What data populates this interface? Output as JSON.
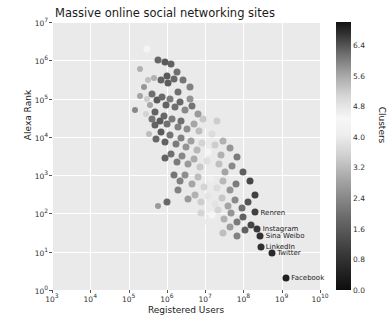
{
  "chart_data": {
    "type": "scatter",
    "title": "Massive online social networking sites",
    "xlabel": "Registered Users",
    "ylabel": "Alexa Rank",
    "xscale": "log",
    "yscale": "log",
    "xlim": [
      1000,
      10000000000
    ],
    "ylim": [
      1,
      10000000
    ],
    "xticklabels": [
      "10^3",
      "10^4",
      "10^5",
      "10^6",
      "10^7",
      "10^8",
      "10^9",
      "10^10"
    ],
    "yticklabels": [
      "10^0",
      "10^1",
      "10^2",
      "10^3",
      "10^4",
      "10^5",
      "10^6",
      "10^7"
    ],
    "grid": true,
    "colorbar": {
      "label": "Clusters",
      "ticks": [
        "0.0",
        "0.8",
        "1.6",
        "2.4",
        "3.2",
        "4.0",
        "4.8",
        "5.6",
        "6.4"
      ],
      "vmin": 0.0,
      "vmax": 7.0
    },
    "annotations": [
      {
        "text": "Renren",
        "x": 220000000.0,
        "y": 100.0
      },
      {
        "text": "Instagram",
        "x": 250000000.0,
        "y": 40.0
      },
      {
        "text": "Sina Weibo",
        "x": 300000000.0,
        "y": 26.0
      },
      {
        "text": "LinkedIn",
        "x": 300000000.0,
        "y": 13.0
      },
      {
        "text": "Twitter",
        "x": 600000000.0,
        "y": 9.0
      },
      {
        "text": "Facebook",
        "x": 1400000000.0,
        "y": 2.0
      }
    ],
    "points": [
      {
        "x": 300000.0,
        "y": 2000000.0,
        "c": 3.6,
        "s": 7
      },
      {
        "x": 600000.0,
        "y": 1000000.0,
        "c": 1.2,
        "s": 7
      },
      {
        "x": 900000.0,
        "y": 900000.0,
        "c": 1.0,
        "s": 7
      },
      {
        "x": 1300000.0,
        "y": 800000.0,
        "c": 1.1,
        "s": 7
      },
      {
        "x": 1800000.0,
        "y": 500000.0,
        "c": 1.3,
        "s": 7
      },
      {
        "x": 320000.0,
        "y": 300000.0,
        "c": 4.4,
        "s": 6
      },
      {
        "x": 450000.0,
        "y": 350000.0,
        "c": 4.6,
        "s": 6
      },
      {
        "x": 700000.0,
        "y": 300000.0,
        "c": 1.1,
        "s": 7
      },
      {
        "x": 1100000.0,
        "y": 260000.0,
        "c": 1.0,
        "s": 7
      },
      {
        "x": 1500000.0,
        "y": 320000.0,
        "c": 1.2,
        "s": 7
      },
      {
        "x": 2600000.0,
        "y": 300000.0,
        "c": 1.4,
        "s": 7
      },
      {
        "x": 4000000.0,
        "y": 200000.0,
        "c": 1.6,
        "s": 7
      },
      {
        "x": 200000.0,
        "y": 120000.0,
        "c": 4.8,
        "s": 6
      },
      {
        "x": 300000.0,
        "y": 100000.0,
        "c": 4.2,
        "s": 6
      },
      {
        "x": 420000.0,
        "y": 130000.0,
        "c": 1.3,
        "s": 7
      },
      {
        "x": 550000.0,
        "y": 90000.0,
        "c": 1.0,
        "s": 7
      },
      {
        "x": 750000.0,
        "y": 110000.0,
        "c": 1.2,
        "s": 7
      },
      {
        "x": 950000.0,
        "y": 70000.0,
        "c": 1.1,
        "s": 7
      },
      {
        "x": 1200000.0,
        "y": 100000.0,
        "c": 1.5,
        "s": 7
      },
      {
        "x": 1600000.0,
        "y": 60000.0,
        "c": 1.3,
        "s": 7
      },
      {
        "x": 2200000.0,
        "y": 80000.0,
        "c": 1.2,
        "s": 7
      },
      {
        "x": 3000000.0,
        "y": 50000.0,
        "c": 1.7,
        "s": 7
      },
      {
        "x": 4500000.0,
        "y": 65000.0,
        "c": 1.4,
        "s": 7
      },
      {
        "x": 6500000.0,
        "y": 40000.0,
        "c": 2.0,
        "s": 7
      },
      {
        "x": 280000.0,
        "y": 40000.0,
        "c": 3.0,
        "s": 6
      },
      {
        "x": 400000.0,
        "y": 30000.0,
        "c": 1.4,
        "s": 7
      },
      {
        "x": 500000.0,
        "y": 45000.0,
        "c": 1.1,
        "s": 7
      },
      {
        "x": 650000.0,
        "y": 26000.0,
        "c": 1.0,
        "s": 7
      },
      {
        "x": 850000.0,
        "y": 36000.0,
        "c": 1.2,
        "s": 7
      },
      {
        "x": 1000000.0,
        "y": 22000.0,
        "c": 1.3,
        "s": 7
      },
      {
        "x": 1400000.0,
        "y": 30000.0,
        "c": 1.5,
        "s": 7
      },
      {
        "x": 1900000.0,
        "y": 18000.0,
        "c": 1.6,
        "s": 7
      },
      {
        "x": 2400000.0,
        "y": 26000.0,
        "c": 1.3,
        "s": 7
      },
      {
        "x": 3400000.0,
        "y": 16000.0,
        "c": 1.8,
        "s": 7
      },
      {
        "x": 5000000.0,
        "y": 22000.0,
        "c": 2.2,
        "s": 7
      },
      {
        "x": 7000000.0,
        "y": 14000.0,
        "c": 2.6,
        "s": 7
      },
      {
        "x": 10000000.0,
        "y": 20000.0,
        "c": 3.4,
        "s": 7
      },
      {
        "x": 15000000.0,
        "y": 12000.0,
        "c": 4.0,
        "s": 7
      },
      {
        "x": 350000.0,
        "y": 12000.0,
        "c": 2.6,
        "s": 6
      },
      {
        "x": 520000.0,
        "y": 9000.0,
        "c": 1.2,
        "s": 7
      },
      {
        "x": 700000.0,
        "y": 13000.0,
        "c": 1.0,
        "s": 7
      },
      {
        "x": 900000.0,
        "y": 7500.0,
        "c": 1.1,
        "s": 7
      },
      {
        "x": 1200000.0,
        "y": 11000.0,
        "c": 1.4,
        "s": 7
      },
      {
        "x": 1700000.0,
        "y": 6500.0,
        "c": 1.5,
        "s": 7
      },
      {
        "x": 2300000.0,
        "y": 9500.0,
        "c": 1.6,
        "s": 7
      },
      {
        "x": 3100000.0,
        "y": 5500.0,
        "c": 1.9,
        "s": 7
      },
      {
        "x": 4200000.0,
        "y": 8000.0,
        "c": 2.1,
        "s": 7
      },
      {
        "x": 6000000.0,
        "y": 4500.0,
        "c": 2.5,
        "s": 7
      },
      {
        "x": 8500000.0,
        "y": 7000.0,
        "c": 3.0,
        "s": 7
      },
      {
        "x": 12000000.0,
        "y": 4000.0,
        "c": 3.6,
        "s": 7
      },
      {
        "x": 18000000.0,
        "y": 6000.0,
        "c": 4.2,
        "s": 7
      },
      {
        "x": 26000000.0,
        "y": 3400.0,
        "c": 4.6,
        "s": 7
      },
      {
        "x": 900000.0,
        "y": 2800.0,
        "c": 1.1,
        "s": 7
      },
      {
        "x": 1300000.0,
        "y": 3600.0,
        "c": 1.3,
        "s": 7
      },
      {
        "x": 1800000.0,
        "y": 2200.0,
        "c": 1.5,
        "s": 7
      },
      {
        "x": 2500000.0,
        "y": 3200.0,
        "c": 1.7,
        "s": 7
      },
      {
        "x": 3600000.0,
        "y": 1900.0,
        "c": 2.0,
        "s": 7
      },
      {
        "x": 5000000.0,
        "y": 2700.0,
        "c": 2.3,
        "s": 7
      },
      {
        "x": 7500000.0,
        "y": 1600.0,
        "c": 2.8,
        "s": 7
      },
      {
        "x": 11000000.0,
        "y": 2400.0,
        "c": 3.2,
        "s": 7
      },
      {
        "x": 16000000.0,
        "y": 1400.0,
        "c": 3.8,
        "s": 7
      },
      {
        "x": 23000000.0,
        "y": 2000.0,
        "c": 4.4,
        "s": 7
      },
      {
        "x": 34000000.0,
        "y": 1200.0,
        "c": 4.8,
        "s": 7
      },
      {
        "x": 50000000.0,
        "y": 1700.0,
        "c": 5.2,
        "s": 7
      },
      {
        "x": 1500000.0,
        "y": 1000.0,
        "c": 1.4,
        "s": 7
      },
      {
        "x": 2200000.0,
        "y": 700.0,
        "c": 1.6,
        "s": 7
      },
      {
        "x": 3000000.0,
        "y": 1000.0,
        "c": 1.8,
        "s": 7
      },
      {
        "x": 4500000.0,
        "y": 600.0,
        "c": 2.2,
        "s": 7
      },
      {
        "x": 6500000.0,
        "y": 900.0,
        "c": 2.6,
        "s": 7
      },
      {
        "x": 9500000.0,
        "y": 500.0,
        "c": 3.0,
        "s": 7
      },
      {
        "x": 14000000.0,
        "y": 800.0,
        "c": 3.5,
        "s": 7
      },
      {
        "x": 20000000.0,
        "y": 450.0,
        "c": 4.0,
        "s": 7
      },
      {
        "x": 30000000.0,
        "y": 700.0,
        "c": 4.5,
        "s": 7
      },
      {
        "x": 45000000.0,
        "y": 400.0,
        "c": 5.0,
        "s": 7
      },
      {
        "x": 65000000.0,
        "y": 600.0,
        "c": 5.4,
        "s": 7
      },
      {
        "x": 1000000.0,
        "y": 200.0,
        "c": 1.2,
        "s": 7
      },
      {
        "x": 3500000.0,
        "y": 240.0,
        "c": 2.0,
        "s": 7
      },
      {
        "x": 5500000.0,
        "y": 300.0,
        "c": 2.4,
        "s": 7
      },
      {
        "x": 8000000.0,
        "y": 200.0,
        "c": 2.9,
        "s": 7
      },
      {
        "x": 12000000.0,
        "y": 280.0,
        "c": 3.3,
        "s": 7
      },
      {
        "x": 18000000.0,
        "y": 180.0,
        "c": 3.9,
        "s": 7
      },
      {
        "x": 27000000.0,
        "y": 260.0,
        "c": 4.3,
        "s": 7
      },
      {
        "x": 40000000.0,
        "y": 160.0,
        "c": 4.8,
        "s": 7
      },
      {
        "x": 60000000.0,
        "y": 220.0,
        "c": 5.2,
        "s": 7
      },
      {
        "x": 90000000.0,
        "y": 140.0,
        "c": 5.6,
        "s": 7
      },
      {
        "x": 130000000.0,
        "y": 200.0,
        "c": 6.0,
        "s": 7
      },
      {
        "x": 15000000.0,
        "y": 90.0,
        "c": 3.6,
        "s": 7
      },
      {
        "x": 22000000.0,
        "y": 120.0,
        "c": 4.1,
        "s": 7
      },
      {
        "x": 32000000.0,
        "y": 70.0,
        "c": 4.6,
        "s": 7
      },
      {
        "x": 48000000.0,
        "y": 100.0,
        "c": 5.0,
        "s": 7
      },
      {
        "x": 70000000.0,
        "y": 60.0,
        "c": 5.4,
        "s": 7
      },
      {
        "x": 100000000.0,
        "y": 80.0,
        "c": 5.8,
        "s": 7
      },
      {
        "x": 160000000.0,
        "y": 50.0,
        "c": 6.2,
        "s": 7
      },
      {
        "x": 200000000.0,
        "y": 110.0,
        "c": 0.6,
        "s": 7
      },
      {
        "x": 30000000.0,
        "y": 30.0,
        "c": 4.4,
        "s": 7
      },
      {
        "x": 45000000.0,
        "y": 45.0,
        "c": 4.9,
        "s": 7
      },
      {
        "x": 70000000.0,
        "y": 26.0,
        "c": 5.3,
        "s": 7
      },
      {
        "x": 110000000.0,
        "y": 36.0,
        "c": 5.8,
        "s": 7
      },
      {
        "x": 230000000.0,
        "y": 40.0,
        "c": 0.5,
        "s": 7
      },
      {
        "x": 270000000.0,
        "y": 26.0,
        "c": 0.4,
        "s": 7
      },
      {
        "x": 280000000.0,
        "y": 13.0,
        "c": 0.4,
        "s": 7
      },
      {
        "x": 550000000.0,
        "y": 9.0,
        "c": 0.3,
        "s": 7
      },
      {
        "x": 1300000000.0,
        "y": 2.0,
        "c": 0.2,
        "s": 7
      },
      {
        "x": 600000.0,
        "y": 160.0,
        "c": 2.0,
        "s": 6
      },
      {
        "x": 200000.0,
        "y": 600000.0,
        "c": 4.6,
        "s": 6
      },
      {
        "x": 250000.0,
        "y": 200000.0,
        "c": 5.0,
        "s": 6
      },
      {
        "x": 150000.0,
        "y": 50000.0,
        "c": 5.2,
        "s": 6
      },
      {
        "x": 8000000.0,
        "y": 100.0,
        "c": 3.0,
        "s": 7
      },
      {
        "x": 12000000.0,
        "y": 60.0,
        "c": 3.4,
        "s": 7
      },
      {
        "x": 2000000.0,
        "y": 400.0,
        "c": 1.6,
        "s": 7
      },
      {
        "x": 500000.0,
        "y": 20000.0,
        "c": 1.1,
        "s": 7
      },
      {
        "x": 360000.0,
        "y": 70000.0,
        "c": 2.2,
        "s": 6
      },
      {
        "x": 1000000.0,
        "y": 400000.0,
        "c": 1.0,
        "s": 7
      },
      {
        "x": 2000000.0,
        "y": 150000.0,
        "c": 1.3,
        "s": 7
      },
      {
        "x": 4000000.0,
        "y": 100000.0,
        "c": 1.9,
        "s": 7
      },
      {
        "x": 9000000.0,
        "y": 30000.0,
        "c": 2.8,
        "s": 7
      },
      {
        "x": 20000000.0,
        "y": 26000.0,
        "c": 4.2,
        "s": 7
      },
      {
        "x": 30000000.0,
        "y": 8000.0,
        "c": 4.6,
        "s": 7
      },
      {
        "x": 45000000.0,
        "y": 5000.0,
        "c": 5.0,
        "s": 7
      },
      {
        "x": 70000000.0,
        "y": 3000.0,
        "c": 5.4,
        "s": 7
      },
      {
        "x": 100000000.0,
        "y": 1200.0,
        "c": 5.8,
        "s": 7
      },
      {
        "x": 150000000.0,
        "y": 700.0,
        "c": 6.2,
        "s": 7
      },
      {
        "x": 200000000.0,
        "y": 300.0,
        "c": 0.6,
        "s": 7
      }
    ]
  }
}
